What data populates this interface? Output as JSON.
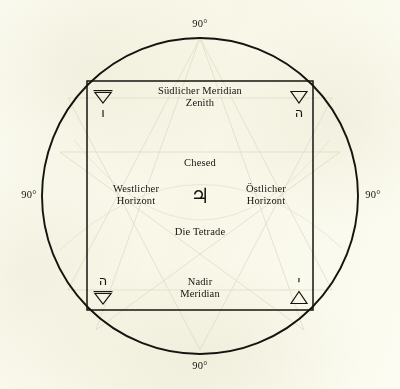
{
  "figure": {
    "title": "Die Tetrade",
    "ink_color": "#15140f",
    "paper_color": "#fcfcf2",
    "ghost_color": "#d8d2bb"
  },
  "angles": {
    "top": "90°",
    "right": "90°",
    "bottom": "90°",
    "left": "90°"
  },
  "cardinal_labels": {
    "top_line1": "Südlicher Meridian",
    "top_line2": "Zenith",
    "left_line1": "Westlicher",
    "left_line2": "Horizont",
    "right_line1": "Östlicher",
    "right_line2": "Horizont",
    "bottom_line1": "Nadir",
    "bottom_line2": "Meridian"
  },
  "center": {
    "sephirah": "Chesed",
    "planet_glyph": "♃",
    "planet_name": "jupiter-symbol",
    "caption": "Die Tetrade"
  },
  "corners": {
    "top_left": {
      "element_glyph": "▽",
      "element_name": "earth-triangle",
      "element_has_bar": true,
      "hebrew_letter": "ו",
      "hebrew_name": "vav"
    },
    "top_right": {
      "element_glyph": "▽",
      "element_name": "water-triangle",
      "element_has_bar": false,
      "hebrew_letter": "ה",
      "hebrew_name": "heh"
    },
    "bottom_left": {
      "element_glyph": "▽",
      "element_name": "earth-triangle",
      "element_has_bar": true,
      "hebrew_letter": "ה",
      "hebrew_name": "heh-final"
    },
    "bottom_right": {
      "element_glyph": "△",
      "element_name": "fire-triangle",
      "element_has_bar": false,
      "hebrew_letter": "י",
      "hebrew_name": "yod"
    }
  },
  "geometry": {
    "circle_center_x": 200,
    "circle_center_y": 196,
    "circle_radius": 158,
    "square_left": 87,
    "square_top": 81,
    "square_right": 313,
    "square_bottom": 310
  }
}
